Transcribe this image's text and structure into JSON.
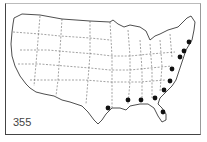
{
  "map": {
    "label": "355",
    "region": "Contiguous United States",
    "style": "outline map with dashed state borders",
    "marker_color": "#111111",
    "markers": [
      {
        "x": 189,
        "y": 42
      },
      {
        "x": 184,
        "y": 51
      },
      {
        "x": 180,
        "y": 57
      },
      {
        "x": 172,
        "y": 69
      },
      {
        "x": 170,
        "y": 81
      },
      {
        "x": 164,
        "y": 90
      },
      {
        "x": 155,
        "y": 98
      },
      {
        "x": 141,
        "y": 100
      },
      {
        "x": 128,
        "y": 100
      },
      {
        "x": 163,
        "y": 112
      },
      {
        "x": 108,
        "y": 108
      }
    ]
  }
}
